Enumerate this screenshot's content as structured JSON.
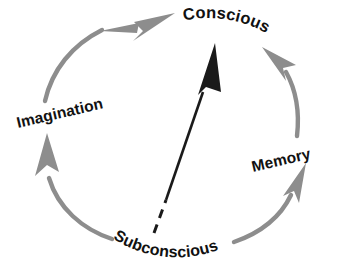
{
  "diagram": {
    "type": "cycle-diagram",
    "background_color": "#ffffff",
    "arc_color": "#8d8d8d",
    "primary_arrow_color": "#1a1a1a",
    "label_color": "#111111",
    "nodes": [
      {
        "id": "conscious",
        "label": "Conscious",
        "position": "top",
        "text_curve": "arc-along-top",
        "rotation_deg": 20
      },
      {
        "id": "imagination",
        "label": "Imagination",
        "position": "left",
        "text_curve": "straight-tilted",
        "rotation_deg": -13
      },
      {
        "id": "memory",
        "label": "Memory",
        "position": "right",
        "text_curve": "straight-tilted",
        "rotation_deg": -13
      },
      {
        "id": "subconscious",
        "label": "Subconscious",
        "position": "bottom",
        "text_curve": "arc-along-bottom",
        "rotation_deg": -8
      }
    ],
    "connections": [
      {
        "id": "subconscious-to-imagination",
        "from": "subconscious",
        "to": "imagination",
        "style": "curved-arrow",
        "color": "#8d8d8d",
        "arrowhead": true
      },
      {
        "id": "imagination-to-conscious",
        "from": "imagination",
        "to": "conscious",
        "style": "curved-arrow",
        "color": "#8d8d8d",
        "arrowhead": true
      },
      {
        "id": "memory-to-conscious",
        "from": "memory",
        "to": "conscious",
        "style": "curved-arrow",
        "color": "#8d8d8d",
        "arrowhead": true
      },
      {
        "id": "subconscious-to-memory",
        "from": "subconscious",
        "to": "memory",
        "style": "curved-arrow",
        "color": "#8d8d8d",
        "arrowhead": true
      },
      {
        "id": "subconscious-to-conscious-direct",
        "from": "subconscious",
        "to": "conscious",
        "style": "straight-dashed-to-solid-arrow",
        "color": "#1a1a1a",
        "arrowhead": true
      }
    ]
  }
}
